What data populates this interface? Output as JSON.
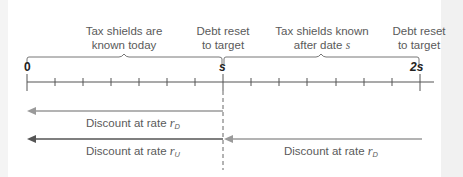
{
  "figure": {
    "annotations": {
      "left_period": {
        "line1": "Tax shields are",
        "line2": "known today"
      },
      "reset_s": {
        "line1": "Debt reset",
        "line2": "to target"
      },
      "right_period": {
        "line1": "Tax shields known",
        "line2": "after date ",
        "line2_var": "s"
      },
      "reset_2s": {
        "line1": "Debt reset",
        "line2": "to target"
      }
    },
    "timeline": {
      "tick_labels": {
        "start": "0",
        "mid": "s",
        "end": "2s"
      },
      "tick_count_per_period": 7
    },
    "arrows": [
      {
        "label": "Discount at rate ",
        "var": "r",
        "subscript": "D",
        "color": "#9a9a9a"
      },
      {
        "label": "Discount at rate ",
        "var": "r",
        "subscript": "U",
        "color": "#555555"
      },
      {
        "label": "Discount at rate ",
        "var": "r",
        "subscript": "D",
        "color": "#9a9a9a"
      }
    ],
    "colors": {
      "axis": "#555555",
      "brace": "#777777",
      "text": "#5a5a5a",
      "light_arrow": "#9a9a9a",
      "dark_arrow": "#555555"
    }
  }
}
